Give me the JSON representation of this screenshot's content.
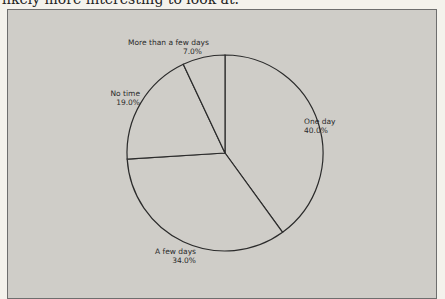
{
  "page": {
    "cutoff_text": "likely more interesting to look at."
  },
  "chart_data": {
    "type": "pie",
    "title": "",
    "categories": [
      "One day",
      "A few days",
      "No time",
      "More than a few days"
    ],
    "values": [
      40.0,
      34.0,
      19.0,
      7.0
    ],
    "value_labels": [
      "40.0%",
      "34.0%",
      "19.0%",
      "7.0%"
    ],
    "start_angle_deg": 0,
    "direction": "clockwise",
    "legend": "none",
    "slice_fill": "#cfcdc8",
    "outline_color": "#2b2b2b",
    "background": "#cfcdc8"
  },
  "labels": {
    "one_day": {
      "name": "One day",
      "pct": "40.0%"
    },
    "a_few_days": {
      "name": "A few days",
      "pct": "34.0%"
    },
    "no_time": {
      "name": "No time",
      "pct": "19.0%"
    },
    "more_than": {
      "name": "More than a few days",
      "pct": "7.0%"
    }
  }
}
